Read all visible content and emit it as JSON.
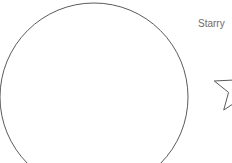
{
  "canvas": {
    "width": 232,
    "height": 163,
    "background_color": "#ffffff"
  },
  "labels": [
    {
      "name": "starry-label",
      "text": "Starry",
      "x": 198,
      "y": 19,
      "font_size": 10,
      "color": "#6b6b6b"
    }
  ],
  "shapes": [
    {
      "name": "circle-shape",
      "type": "circle",
      "center_x": 94,
      "center_y": 97,
      "radius": 94,
      "stroke_color": "#5a5a5a",
      "stroke_width": 1,
      "fill": "none",
      "clipped_edges": "left,bottom"
    },
    {
      "name": "star-shape",
      "type": "star",
      "points": 5,
      "center_x": 239,
      "center_y": 89,
      "outer_radius": 26,
      "inner_radius": 11,
      "rotation_deg": -90,
      "stroke_color": "#5a5a5a",
      "stroke_width": 1,
      "fill": "none",
      "clipped_edges": "right"
    }
  ]
}
